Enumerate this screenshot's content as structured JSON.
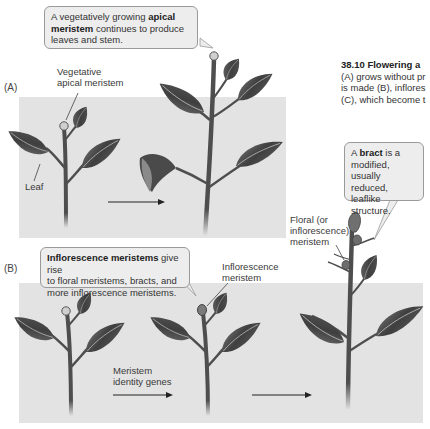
{
  "figure": {
    "caption": {
      "title": "38.10  Flowering a",
      "lines": [
        "(A) grows without pr",
        "is made (B), inflores",
        "(C), which become t"
      ]
    },
    "panels": {
      "A": {
        "letter": "(A)",
        "labels": {
          "vegetative_meristem_line1": "Vegetative",
          "vegetative_meristem_line2": "apical meristem",
          "leaf": "Leaf"
        },
        "bubble": {
          "prefix": "A vegetatively growing ",
          "bold1": "apical",
          "bold2": "meristem",
          "suffix": " continues to produce",
          "line3": "leaves and stem."
        }
      },
      "B": {
        "letter": "(B)",
        "labels": {
          "inflorescence_meristem_line1": "Inflorescence",
          "inflorescence_meristem_line2": "meristem",
          "arrow_label_line1": "Meristem",
          "arrow_label_line2": "identity genes",
          "floral_line1": "Floral (or",
          "floral_line2": "inflorescence)",
          "floral_line3": "meristem"
        },
        "bubble": {
          "bold": "Inflorescence meristems",
          "suffix": " give rise",
          "line2": "to floral meristems, bracts, and",
          "line3": "more inflorescence meristems."
        }
      },
      "bract_bubble": {
        "prefix": "A ",
        "bold": "bract",
        "suffix": " is a",
        "line2": "modified, usually",
        "line3": "reduced, leaflike",
        "line4": "structure."
      }
    },
    "colors": {
      "panel_bg": "#e3e3e3",
      "leaf": "#4a4a4a",
      "stem": "#4e4e4e",
      "bubble_bg": "#ededed"
    }
  }
}
